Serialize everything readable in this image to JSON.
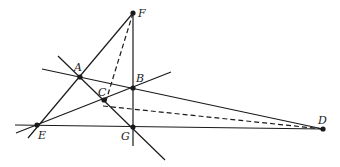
{
  "diagram": {
    "type": "geometry",
    "colors": {
      "line": "#1a1a1a",
      "background": "#ffffff"
    },
    "points": [
      {
        "id": "F",
        "label": "F",
        "x": 133,
        "y": 13,
        "lx": 138,
        "ly": 17
      },
      {
        "id": "A",
        "label": "A",
        "x": 80,
        "y": 77,
        "lx": 74,
        "ly": 71
      },
      {
        "id": "B",
        "label": "B",
        "x": 133,
        "y": 88,
        "lx": 136,
        "ly": 82
      },
      {
        "id": "C",
        "label": "C",
        "x": 104,
        "y": 100,
        "lx": 98,
        "ly": 96
      },
      {
        "id": "G",
        "label": "G",
        "x": 133,
        "y": 127,
        "lx": 121,
        "ly": 140
      },
      {
        "id": "E",
        "label": "E",
        "x": 37,
        "y": 125,
        "lx": 38,
        "ly": 139
      },
      {
        "id": "D",
        "label": "D",
        "x": 323,
        "y": 129,
        "lx": 318,
        "ly": 124
      }
    ],
    "lines": [
      {
        "name": "line-AD",
        "x1": 42,
        "y1": 69,
        "x2": 323,
        "y2": 129,
        "dashed": false
      },
      {
        "name": "line-EB",
        "x1": 16,
        "y1": 133,
        "x2": 171,
        "y2": 72,
        "dashed": false
      },
      {
        "name": "line-AG",
        "x1": 58,
        "y1": 56,
        "x2": 165,
        "y2": 160,
        "dashed": false
      },
      {
        "name": "line-EF",
        "x1": 28,
        "y1": 138,
        "x2": 133,
        "y2": 13,
        "dashed": false
      },
      {
        "name": "line-FG",
        "x1": 133,
        "y1": 13,
        "x2": 133,
        "y2": 146,
        "dashed": false
      },
      {
        "name": "line-ED",
        "x1": 15,
        "y1": 125,
        "x2": 323,
        "y2": 129,
        "dashed": false
      },
      {
        "name": "dashed-FC",
        "x1": 133,
        "y1": 13,
        "x2": 105,
        "y2": 104,
        "dashed": true
      },
      {
        "name": "dashed-CD",
        "x1": 103,
        "y1": 106,
        "x2": 323,
        "y2": 129,
        "dashed": true
      }
    ]
  }
}
